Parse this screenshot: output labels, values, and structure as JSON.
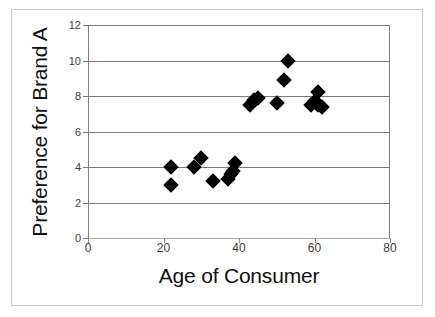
{
  "chart_data": {
    "type": "scatter",
    "title": "",
    "xlabel": "Age of Consumer",
    "ylabel": "Preference for Brand A",
    "xlim": [
      0,
      80
    ],
    "ylim": [
      0,
      12
    ],
    "xticks": [
      0,
      20,
      40,
      60,
      80
    ],
    "yticks": [
      0,
      2,
      4,
      6,
      8,
      10,
      12
    ],
    "xtick_labels": [
      "0",
      "20",
      "40",
      "60",
      "80"
    ],
    "ytick_labels": [
      "0",
      "2",
      "4",
      "6",
      "8",
      "10",
      "12"
    ],
    "grid": "horizontal",
    "legend": null,
    "marker": "diamond",
    "marker_color": "#000000",
    "points": [
      {
        "x": 22,
        "y": 4.0
      },
      {
        "x": 22,
        "y": 3.0
      },
      {
        "x": 28,
        "y": 4.0
      },
      {
        "x": 30,
        "y": 4.5
      },
      {
        "x": 33,
        "y": 3.2
      },
      {
        "x": 37,
        "y": 3.3
      },
      {
        "x": 38,
        "y": 3.6
      },
      {
        "x": 38.5,
        "y": 3.8
      },
      {
        "x": 39,
        "y": 4.2
      },
      {
        "x": 43,
        "y": 7.5
      },
      {
        "x": 44,
        "y": 7.8
      },
      {
        "x": 45,
        "y": 7.9
      },
      {
        "x": 50,
        "y": 7.6
      },
      {
        "x": 53,
        "y": 10.0
      },
      {
        "x": 52,
        "y": 8.9
      },
      {
        "x": 59,
        "y": 7.5
      },
      {
        "x": 60,
        "y": 7.7
      },
      {
        "x": 61,
        "y": 8.2
      },
      {
        "x": 61,
        "y": 7.5
      },
      {
        "x": 62,
        "y": 7.4
      }
    ]
  },
  "axes": {
    "x_title": "Age of Consumer",
    "y_title": "Preference for Brand A"
  }
}
